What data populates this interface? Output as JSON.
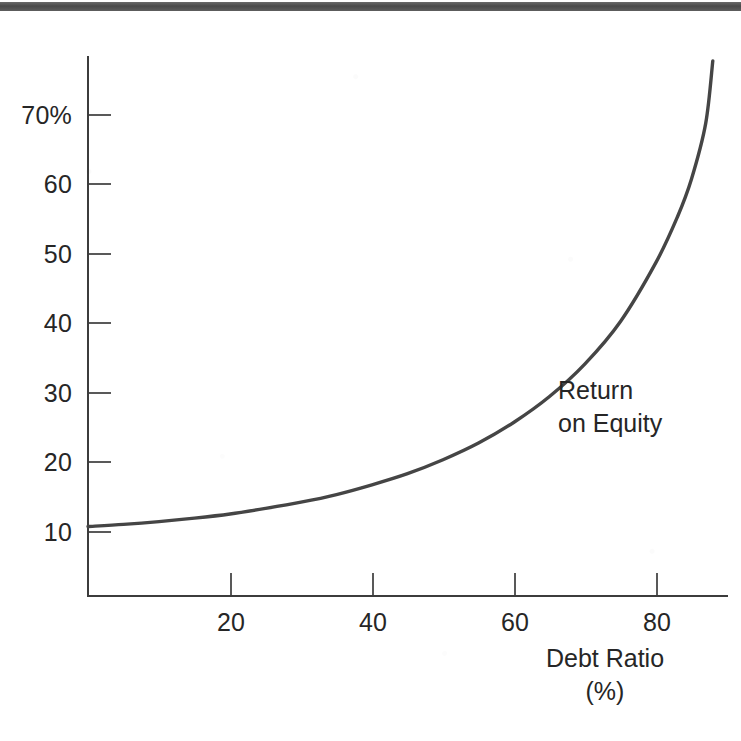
{
  "figure": {
    "background_color": "#ffffff",
    "ink_color": "#2b2b2b",
    "curve_color": "#454545",
    "axis_color": "#3c3c3c",
    "page_edge_bar_color": "#4a4a4a"
  },
  "annotation": {
    "line1": "Return",
    "line2": "on Equity"
  },
  "x_axis_title": {
    "line1": "Debt Ratio",
    "line2": "(%)"
  },
  "y_tick_labels": [
    "70%",
    "60",
    "50",
    "40",
    "30",
    "20",
    "10"
  ],
  "x_tick_labels": [
    "20",
    "40",
    "60",
    "80"
  ],
  "chart_data": {
    "type": "line",
    "title": "",
    "subtitle": "",
    "xlabel": "Debt Ratio (%)",
    "ylabel": "Return on Equity (%)",
    "xlim": [
      0,
      90
    ],
    "ylim": [
      0,
      78
    ],
    "grid": false,
    "legend": null,
    "annotations": [
      {
        "text": "Return on Equity",
        "x": 66,
        "y": 32,
        "note": "inline curve label, unboxed, to the right of the curve"
      }
    ],
    "x_ticks": [
      20,
      40,
      60,
      80
    ],
    "y_ticks": [
      10,
      20,
      30,
      40,
      50,
      60,
      70
    ],
    "y_tick_suffix_on_top_only": "%",
    "series": [
      {
        "name": "Return on Equity",
        "color": "#454545",
        "linewidth": 3.4,
        "x": [
          0,
          5,
          10,
          15,
          20,
          25,
          30,
          35,
          40,
          45,
          50,
          55,
          60,
          65,
          70,
          75,
          80,
          83,
          85,
          87,
          88
        ],
        "y": [
          10.0,
          10.3,
          10.7,
          11.2,
          11.8,
          12.6,
          13.5,
          14.6,
          16.0,
          17.6,
          19.6,
          22.0,
          25.0,
          28.7,
          33.4,
          39.5,
          48.0,
          54.5,
          60.0,
          68.0,
          77.0
        ]
      }
    ]
  },
  "axis_geometry": {
    "x_origin_px": 88,
    "y_origin_px": 596,
    "y_axis_top_px": 57,
    "x_per_unit_px": 7.1,
    "y_per_unit_px": 6.95,
    "y_value_at_origin": 0
  }
}
